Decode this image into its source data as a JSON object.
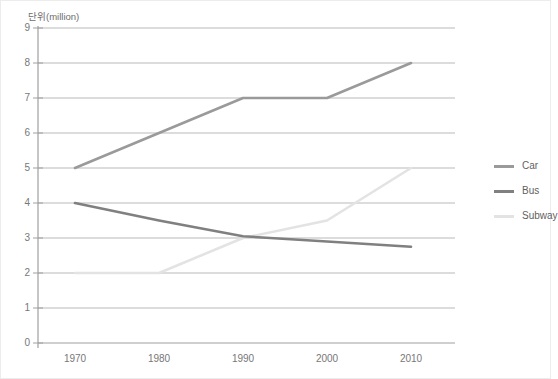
{
  "chart_data": {
    "type": "line",
    "title": "",
    "ylabel": "단위(million)",
    "xlabel": "",
    "categories": [
      "1970",
      "1980",
      "1990",
      "2000",
      "2010"
    ],
    "x": [
      1970,
      1980,
      1990,
      2000,
      2010
    ],
    "ylim": [
      0,
      9
    ],
    "yticks": [
      "0",
      "1",
      "2",
      "3",
      "4",
      "5",
      "6",
      "7",
      "8",
      "9"
    ],
    "grid": true,
    "legend_position": "right",
    "series": [
      {
        "name": "Car",
        "color": "#9a9a9a",
        "values": [
          5,
          6,
          7,
          7,
          8
        ]
      },
      {
        "name": "Bus",
        "color": "#808080",
        "values": [
          4,
          3.5,
          3.05,
          2.9,
          2.75
        ]
      },
      {
        "name": "Subway",
        "color": "#e3e3e3",
        "values": [
          2,
          2,
          3,
          3.5,
          5
        ]
      }
    ]
  },
  "axes": {
    "y_axis_title": "단위(million)",
    "y_tick_labels": [
      "9",
      "8",
      "7",
      "6",
      "5",
      "4",
      "3",
      "2",
      "1",
      "0"
    ],
    "x_tick_labels": [
      "1970",
      "1980",
      "1990",
      "2000",
      "2010"
    ]
  },
  "legend": {
    "items": [
      {
        "label": "Car",
        "color": "#9a9a9a"
      },
      {
        "label": "Bus",
        "color": "#808080"
      },
      {
        "label": "Subway",
        "color": "#e3e3e3"
      }
    ]
  },
  "colors": {
    "gridline": "#b9b9b9",
    "axis": "#9f9f9f",
    "tick_text": "#777777",
    "frame": "#ececec",
    "background": "#ffffff"
  }
}
